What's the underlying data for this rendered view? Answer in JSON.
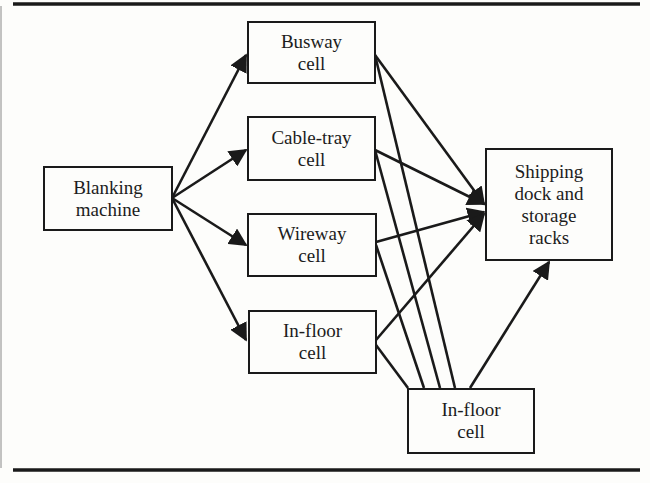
{
  "diagram": {
    "type": "flow",
    "nodes": [
      {
        "id": "blanking",
        "lines": [
          "Blanking",
          "machine"
        ]
      },
      {
        "id": "busway",
        "lines": [
          "Busway",
          "cell"
        ]
      },
      {
        "id": "cabletray",
        "lines": [
          "Cable-tray",
          "cell"
        ]
      },
      {
        "id": "wireway",
        "lines": [
          "Wireway",
          "cell"
        ]
      },
      {
        "id": "infloor1",
        "lines": [
          "In-floor",
          "cell"
        ]
      },
      {
        "id": "shipping",
        "lines": [
          "Shipping",
          "dock and",
          "storage",
          "racks"
        ]
      },
      {
        "id": "infloor2",
        "lines": [
          "In-floor",
          "cell"
        ]
      }
    ],
    "edges": [
      {
        "from": "blanking",
        "to": "busway",
        "arrow": true
      },
      {
        "from": "blanking",
        "to": "cabletray",
        "arrow": true
      },
      {
        "from": "blanking",
        "to": "wireway",
        "arrow": true
      },
      {
        "from": "blanking",
        "to": "infloor1",
        "arrow": true
      },
      {
        "from": "busway",
        "to": "shipping",
        "arrow": true
      },
      {
        "from": "cabletray",
        "to": "shipping",
        "arrow": true
      },
      {
        "from": "wireway",
        "to": "shipping",
        "arrow": true
      },
      {
        "from": "infloor1",
        "to": "shipping",
        "arrow": true
      },
      {
        "from": "busway",
        "to": "infloor2",
        "arrow": false
      },
      {
        "from": "cabletray",
        "to": "infloor2",
        "arrow": false
      },
      {
        "from": "wireway",
        "to": "infloor2",
        "arrow": false
      },
      {
        "from": "infloor1",
        "to": "infloor2",
        "arrow": false
      },
      {
        "from": "infloor2",
        "to": "shipping",
        "arrow": true
      }
    ],
    "colors": {
      "line": "#1a1a1a",
      "background": "#fdfdfb",
      "text": "#1c1c1c"
    }
  }
}
